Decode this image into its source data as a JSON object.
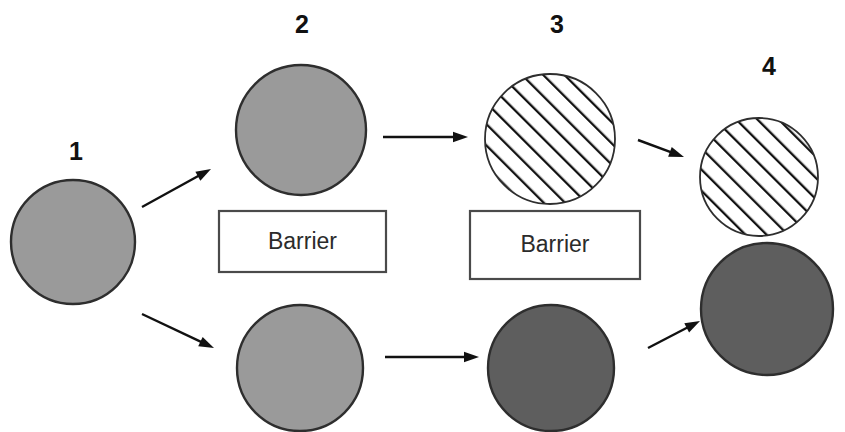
{
  "diagram": {
    "background_color": "#ffffff",
    "colors": {
      "light_gray_fill": "#9a9a9a",
      "dark_gray_fill": "#5e5e5e",
      "hatch_fill": "#ffffff",
      "hatch_line": "#111111",
      "outline": "#2e2e2e",
      "arrow": "#111111",
      "box_stroke": "#4a4a4a",
      "label_text": "#111111",
      "barrier_text": "#2b2b2b"
    },
    "stage_labels": [
      {
        "id": "stage-1",
        "text": "1",
        "x": 76,
        "y": 153
      },
      {
        "id": "stage-2",
        "text": "2",
        "x": 302,
        "y": 26
      },
      {
        "id": "stage-3",
        "text": "3",
        "x": 557,
        "y": 26
      },
      {
        "id": "stage-4",
        "text": "4",
        "x": 769,
        "y": 68
      }
    ],
    "circles": [
      {
        "id": "circle-stage-1",
        "style": "light-gray",
        "cx": 73,
        "cy": 242,
        "r": 62
      },
      {
        "id": "circle-stage-2-top",
        "style": "light-gray",
        "cx": 301,
        "cy": 130,
        "r": 65
      },
      {
        "id": "circle-stage-2-bottom",
        "style": "light-gray",
        "cx": 300,
        "cy": 368,
        "r": 63
      },
      {
        "id": "circle-stage-3-top",
        "style": "hatched",
        "cx": 550,
        "cy": 139,
        "r": 65
      },
      {
        "id": "circle-stage-3-bottom",
        "style": "dark-gray",
        "cx": 551,
        "cy": 368,
        "r": 63
      },
      {
        "id": "circle-stage-4-top",
        "style": "hatched",
        "cx": 759,
        "cy": 177,
        "r": 59
      },
      {
        "id": "circle-stage-4-bottom",
        "style": "dark-gray",
        "cx": 767,
        "cy": 309,
        "r": 66
      }
    ],
    "barriers": [
      {
        "id": "barrier-left",
        "label": "Barrier",
        "x": 219,
        "y": 211,
        "width": 167,
        "height": 61
      },
      {
        "id": "barrier-right",
        "label": "Barrier",
        "x": 470,
        "y": 211,
        "width": 170,
        "height": 68
      }
    ],
    "arrows": [
      {
        "id": "arrow-1-to-2-top",
        "x1": 142,
        "y1": 207,
        "x2": 211,
        "y2": 169
      },
      {
        "id": "arrow-1-to-2-bottom",
        "x1": 142,
        "y1": 314,
        "x2": 214,
        "y2": 348
      },
      {
        "id": "arrow-2-to-3-top",
        "x1": 383,
        "y1": 137,
        "x2": 468,
        "y2": 137
      },
      {
        "id": "arrow-2-to-3-bottom",
        "x1": 385,
        "y1": 357,
        "x2": 479,
        "y2": 357
      },
      {
        "id": "arrow-3-to-4-top",
        "x1": 638,
        "y1": 140,
        "x2": 684,
        "y2": 157
      },
      {
        "id": "arrow-3-to-4-bottom",
        "x1": 648,
        "y1": 348,
        "x2": 700,
        "y2": 321
      }
    ]
  }
}
